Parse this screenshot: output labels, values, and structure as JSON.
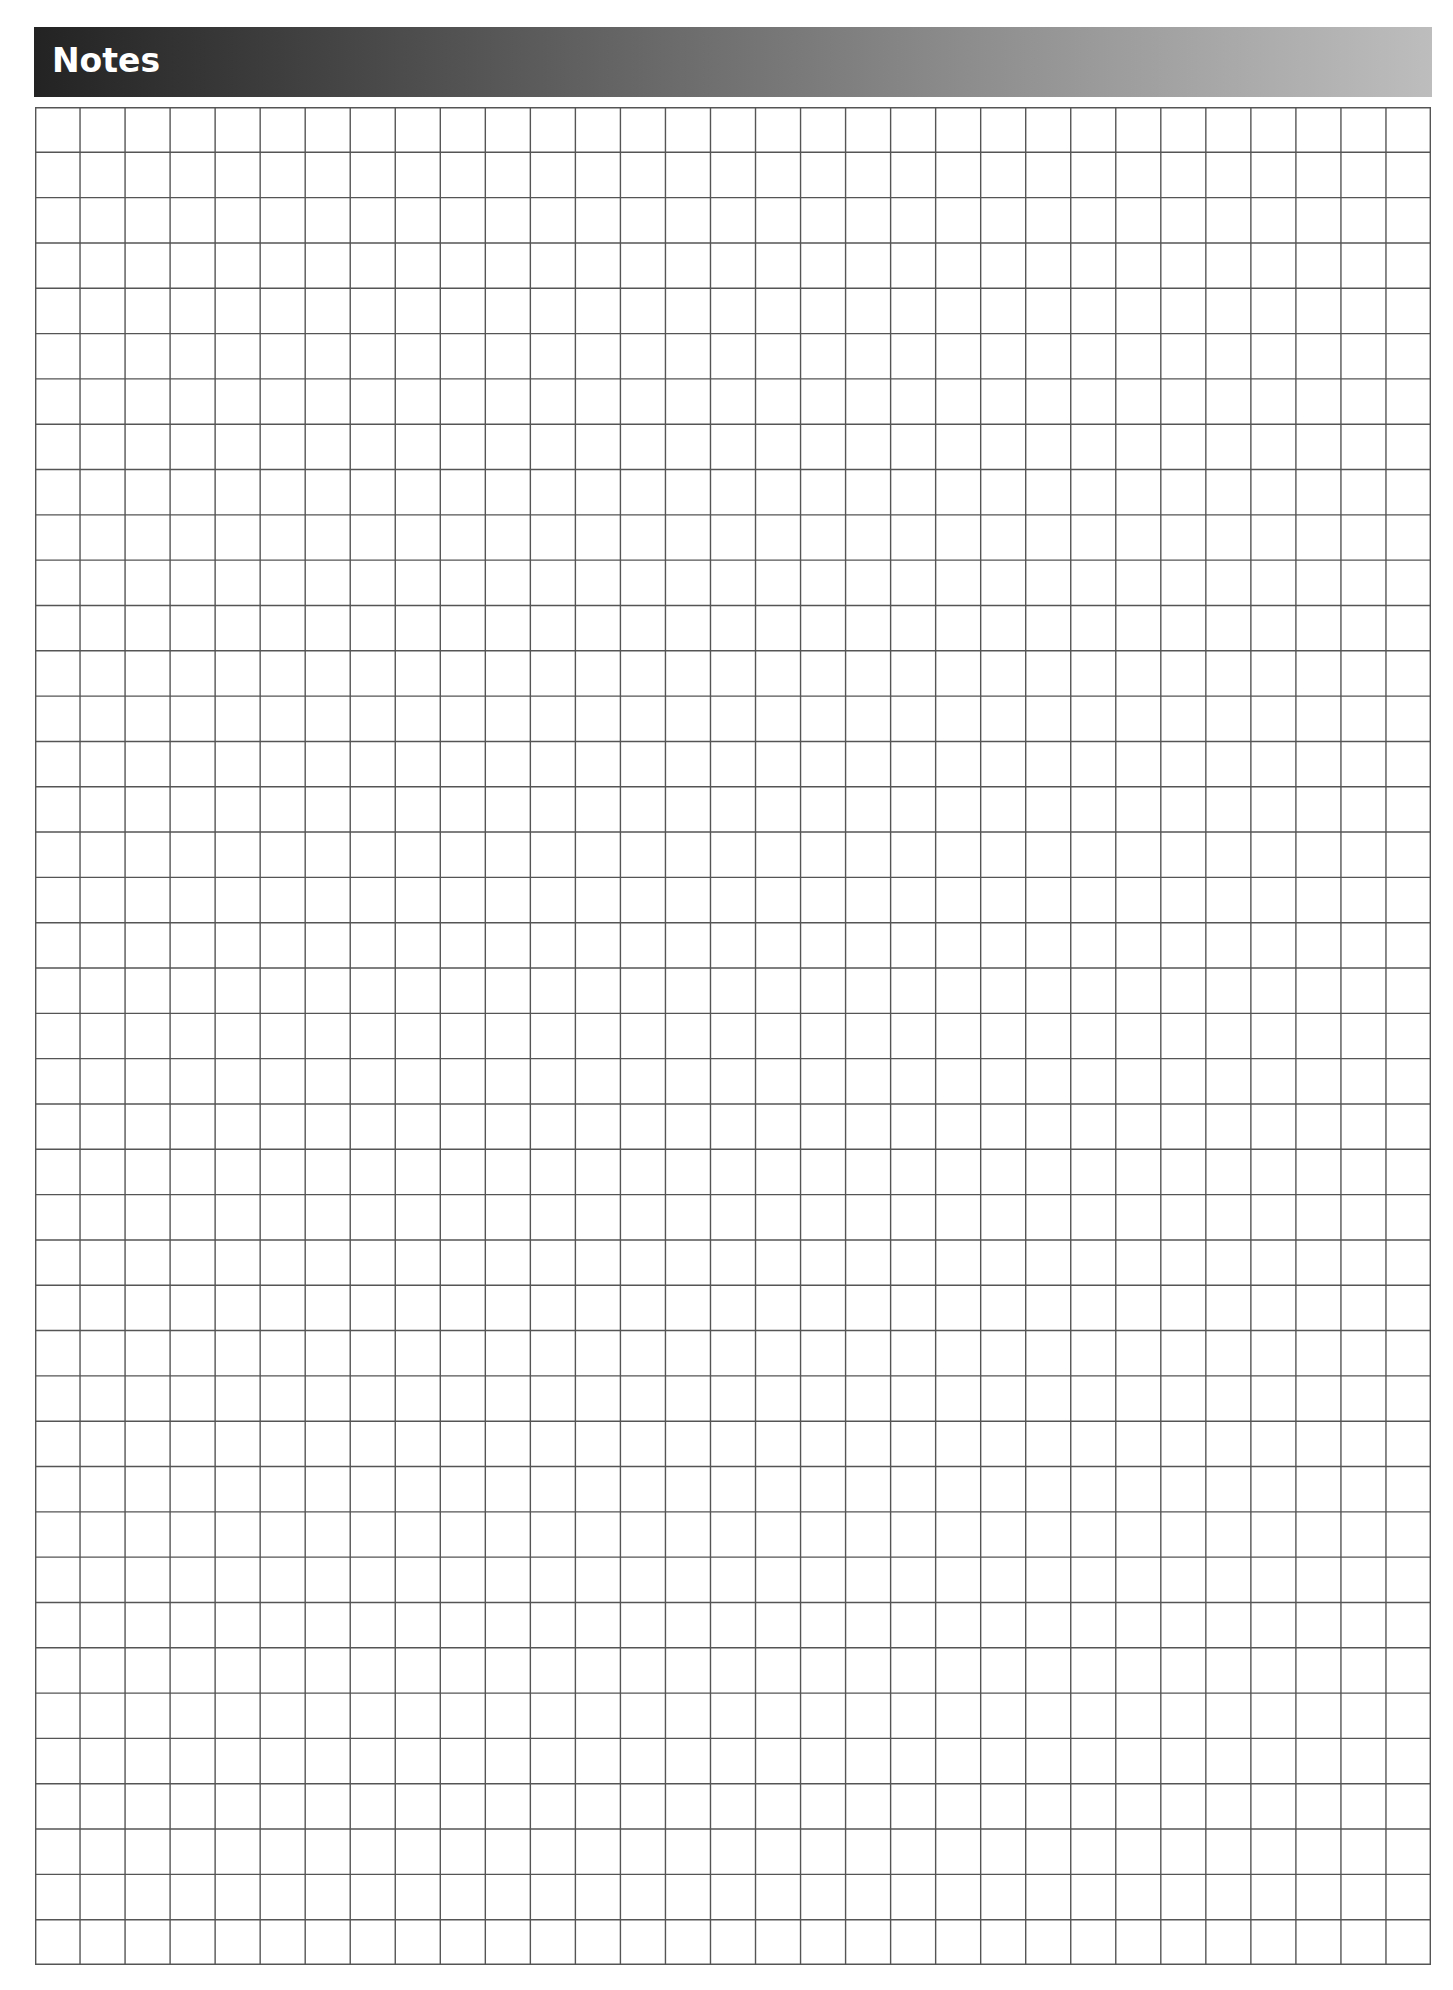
{
  "header": {
    "title": "Notes"
  },
  "grid": {
    "columns": 31,
    "rows": 41,
    "line_color": "#555555",
    "line_width": 1.4
  },
  "colors": {
    "header_gradient_start": "#232323",
    "header_gradient_end": "#bdbdbd",
    "header_text": "#ffffff",
    "page_background": "#ffffff"
  }
}
